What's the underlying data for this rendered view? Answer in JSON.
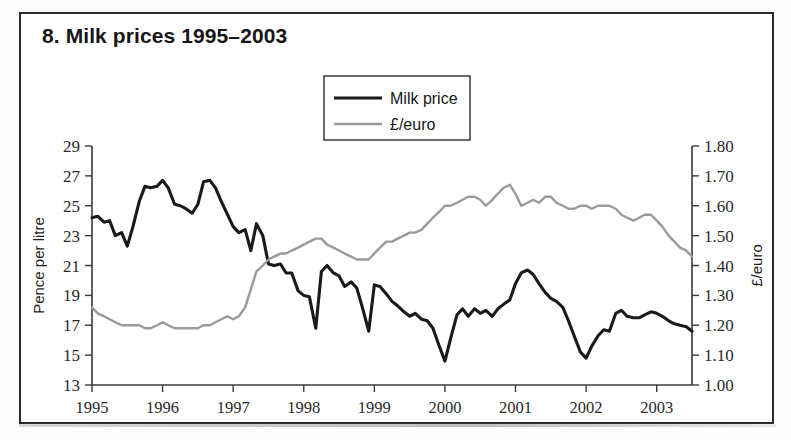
{
  "figure": {
    "title": "8. Milk prices 1995–2003",
    "border_color": "#2b2b2b"
  },
  "legend": {
    "position": "top-center",
    "items": [
      {
        "label": "Milk price",
        "color": "#1a1a1a",
        "width": 3.2
      },
      {
        "label": "£/euro",
        "color": "#9a9a9a",
        "width": 2.6
      }
    ]
  },
  "chart_data": {
    "type": "line",
    "title": "8. Milk prices 1995–2003",
    "xlabel": "",
    "ylabel": "Pence per litre",
    "y2label": "£/euro",
    "grid": false,
    "xlim": [
      1995.0,
      2003.5
    ],
    "ylim": [
      13,
      29
    ],
    "y2lim": [
      1.0,
      1.8
    ],
    "yticks": [
      13,
      15,
      17,
      19,
      21,
      23,
      25,
      27,
      29
    ],
    "ytick_labels": [
      "13",
      "15",
      "17",
      "19",
      "21",
      "23",
      "25",
      "27",
      "29"
    ],
    "y2ticks": [
      1.0,
      1.1,
      1.2,
      1.3,
      1.4,
      1.5,
      1.6,
      1.7,
      1.8
    ],
    "y2tick_labels": [
      "1.00",
      "1.10",
      "1.20",
      "1.30",
      "1.40",
      "1.50",
      "1.60",
      "1.70",
      "1.80"
    ],
    "xticks": [
      1995,
      1996,
      1997,
      1998,
      1999,
      2000,
      2001,
      2002,
      2003
    ],
    "xtick_labels": [
      "1995",
      "1996",
      "1997",
      "1998",
      "1999",
      "2000",
      "2001",
      "2002",
      "2003"
    ],
    "x": [
      1995.0,
      1995.08,
      1995.17,
      1995.25,
      1995.33,
      1995.42,
      1995.5,
      1995.58,
      1995.67,
      1995.75,
      1995.83,
      1995.92,
      1996.0,
      1996.08,
      1996.17,
      1996.25,
      1996.33,
      1996.42,
      1996.5,
      1996.58,
      1996.67,
      1996.75,
      1996.83,
      1996.92,
      1997.0,
      1997.08,
      1997.17,
      1997.25,
      1997.33,
      1997.42,
      1997.5,
      1997.58,
      1997.67,
      1997.75,
      1997.83,
      1997.92,
      1998.0,
      1998.08,
      1998.17,
      1998.25,
      1998.33,
      1998.42,
      1998.5,
      1998.58,
      1998.67,
      1998.75,
      1998.83,
      1998.92,
      1999.0,
      1999.08,
      1999.17,
      1999.25,
      1999.33,
      1999.42,
      1999.5,
      1999.58,
      1999.67,
      1999.75,
      1999.83,
      1999.92,
      2000.0,
      2000.08,
      2000.17,
      2000.25,
      2000.33,
      2000.42,
      2000.5,
      2000.58,
      2000.67,
      2000.75,
      2000.83,
      2000.92,
      2001.0,
      2001.08,
      2001.17,
      2001.25,
      2001.33,
      2001.42,
      2001.5,
      2001.58,
      2001.67,
      2001.75,
      2001.83,
      2001.92,
      2002.0,
      2002.08,
      2002.17,
      2002.25,
      2002.33,
      2002.42,
      2002.5,
      2002.58,
      2002.67,
      2002.75,
      2002.83,
      2002.92,
      2003.0,
      2003.08,
      2003.17,
      2003.25,
      2003.33,
      2003.42,
      2003.5
    ],
    "series": [
      {
        "name": "Milk price",
        "axis": "left",
        "unit": "pence per litre",
        "color": "#1a1a1a",
        "values": [
          24.2,
          24.3,
          23.9,
          24.0,
          23.0,
          23.2,
          22.3,
          23.6,
          25.3,
          26.3,
          26.2,
          26.3,
          26.7,
          26.2,
          25.1,
          25.0,
          24.8,
          24.5,
          25.1,
          26.6,
          26.7,
          26.2,
          25.3,
          24.4,
          23.6,
          23.2,
          23.4,
          22.0,
          23.8,
          23.0,
          21.1,
          21.0,
          21.1,
          20.5,
          20.5,
          19.3,
          19.0,
          18.9,
          16.8,
          20.6,
          21.0,
          20.5,
          20.3,
          19.6,
          19.9,
          19.5,
          18.2,
          16.6,
          19.7,
          19.6,
          19.1,
          18.6,
          18.3,
          17.9,
          17.6,
          17.8,
          17.4,
          17.3,
          16.8,
          15.6,
          14.6,
          16.1,
          17.7,
          18.1,
          17.6,
          18.1,
          17.8,
          18.0,
          17.6,
          18.1,
          18.4,
          18.7,
          19.8,
          20.5,
          20.7,
          20.4,
          19.8,
          19.2,
          18.8,
          18.6,
          18.2,
          17.3,
          16.3,
          15.2,
          14.8,
          15.6,
          16.3,
          16.7,
          16.6,
          17.8,
          18.0,
          17.6,
          17.5,
          17.5,
          17.7,
          17.9,
          17.8,
          17.6,
          17.3,
          17.1,
          17.0,
          16.9,
          16.6
        ]
      },
      {
        "name": "£/euro",
        "axis": "right",
        "unit": "£/euro",
        "color": "#9a9a9a",
        "values": [
          1.26,
          1.24,
          1.23,
          1.22,
          1.21,
          1.2,
          1.2,
          1.2,
          1.2,
          1.19,
          1.19,
          1.2,
          1.21,
          1.2,
          1.19,
          1.19,
          1.19,
          1.19,
          1.19,
          1.2,
          1.2,
          1.21,
          1.22,
          1.23,
          1.22,
          1.23,
          1.26,
          1.32,
          1.38,
          1.4,
          1.42,
          1.43,
          1.44,
          1.44,
          1.45,
          1.46,
          1.47,
          1.48,
          1.49,
          1.49,
          1.47,
          1.46,
          1.45,
          1.44,
          1.43,
          1.42,
          1.42,
          1.42,
          1.44,
          1.46,
          1.48,
          1.48,
          1.49,
          1.5,
          1.51,
          1.51,
          1.52,
          1.54,
          1.56,
          1.58,
          1.6,
          1.6,
          1.61,
          1.62,
          1.63,
          1.63,
          1.62,
          1.6,
          1.62,
          1.64,
          1.66,
          1.67,
          1.64,
          1.6,
          1.61,
          1.62,
          1.61,
          1.63,
          1.63,
          1.61,
          1.6,
          1.59,
          1.59,
          1.6,
          1.6,
          1.59,
          1.6,
          1.6,
          1.6,
          1.59,
          1.57,
          1.56,
          1.55,
          1.56,
          1.57,
          1.57,
          1.55,
          1.53,
          1.5,
          1.48,
          1.46,
          1.45,
          1.43
        ]
      }
    ]
  },
  "axes": {
    "left_title": "Pence per litre",
    "right_title": "£/euro"
  }
}
